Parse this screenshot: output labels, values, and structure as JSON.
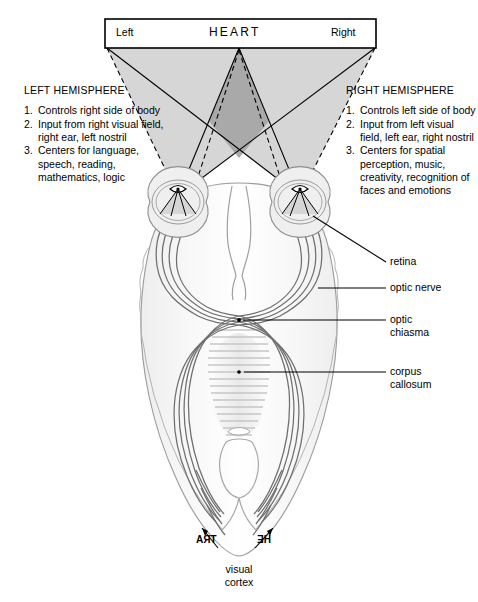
{
  "figure": {
    "background_color": "#ffffff",
    "ink_color": "#000000"
  },
  "stimulus_box": {
    "left_label": "Left",
    "word": "HEART",
    "right_label": "Right",
    "border_color": "#000000",
    "fill_color": "#ffffff"
  },
  "visual_field": {
    "outer_fill": "#d6d6d6",
    "overlap_fill": "#a9a9a9",
    "outline_color": "#000000",
    "dashed_ray_color": "#000000"
  },
  "left_hemisphere": {
    "heading": "LEFT HEMISPHERE",
    "items": [
      {
        "num": "1.",
        "text": "Controls right side\nof body"
      },
      {
        "num": "2.",
        "text": "Input from right\nvisual field, right ear,\nleft nostril"
      },
      {
        "num": "3.",
        "text": "Centers for language,\nspeech, reading,\nmathematics,\nlogic"
      }
    ]
  },
  "right_hemisphere": {
    "heading": "RIGHT HEMISPHERE",
    "items": [
      {
        "num": "1.",
        "text": "Controls left side\nof body"
      },
      {
        "num": "2.",
        "text": "Input from left\nvisual field, left\near, right nostril"
      },
      {
        "num": "3.",
        "text": "Centers for spatial\nperception, music,\ncreativity, recognition\nof faces and\nemotions"
      }
    ]
  },
  "anatomy_labels": {
    "retina": "retina",
    "optic_nerve": "optic nerve",
    "optic_chiasma": "optic\nchiasma",
    "corpus_callosum": "corpus\ncallosum",
    "visual_cortex": "visual\ncortex"
  },
  "cortex_projection": {
    "left_cortex_text": "TRA",
    "right_cortex_text": "HE",
    "note_rendering": "mirror-reversed inverted retinal image of HEART"
  },
  "brain": {
    "fill_color": "#f4f4f4",
    "outline_color": "#8c8c8c",
    "tract_color": "#6f6f6f",
    "callosum_color": "#cfcfcf"
  }
}
